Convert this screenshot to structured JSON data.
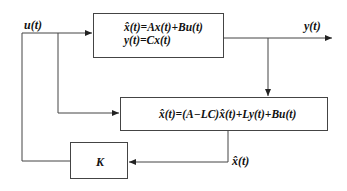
{
  "diagram": {
    "type": "block-diagram",
    "blocks": {
      "plant": {
        "line1": "x̂(t)=Ax(t)+Bu(t)",
        "line2": "y(t)=Cx(t)"
      },
      "observer": {
        "equation": "x̂(t)=(A−LC)x̂(t)+Ly(t)+Bu(t)"
      },
      "gain": {
        "label": "K"
      }
    },
    "signals": {
      "input": "u(t)",
      "output": "y(t)",
      "estimate": "x̂(t)"
    },
    "colors": {
      "line": "#444444",
      "text": "#111111",
      "background": "#ffffff"
    }
  }
}
